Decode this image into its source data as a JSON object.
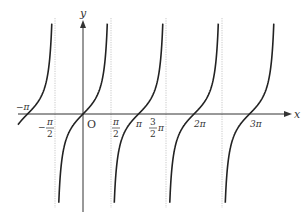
{
  "diagram": {
    "axes": {
      "x_label": "x",
      "y_label": "y",
      "origin_label": "O"
    },
    "tick_labels": [
      {
        "id": "neg_pi",
        "text": "−π"
      },
      {
        "id": "neg_half_pi_num",
        "text": "π"
      },
      {
        "id": "neg_half_pi_den",
        "text": "2"
      },
      {
        "id": "neg_half_pi_sign",
        "text": "−"
      },
      {
        "id": "half_pi_num",
        "text": "π"
      },
      {
        "id": "half_pi_den",
        "text": "2"
      },
      {
        "id": "pi",
        "text": "π"
      },
      {
        "id": "three_half_pi_num",
        "text": "3"
      },
      {
        "id": "three_half_pi_den",
        "text": "2"
      },
      {
        "id": "three_half_pi_pi",
        "text": "π"
      },
      {
        "id": "two_pi",
        "text": "2π"
      },
      {
        "id": "three_pi",
        "text": "3π"
      }
    ],
    "asymptotes_at": [
      "-π/2",
      "π/2",
      "3π/2",
      "5π/2"
    ],
    "zeros_at": [
      "-π",
      "0",
      "π",
      "2π",
      "3π"
    ],
    "branches": 5,
    "colors": {
      "curve": "#222222",
      "axis": "#333333",
      "asymptote": "#bbbbbb"
    }
  }
}
